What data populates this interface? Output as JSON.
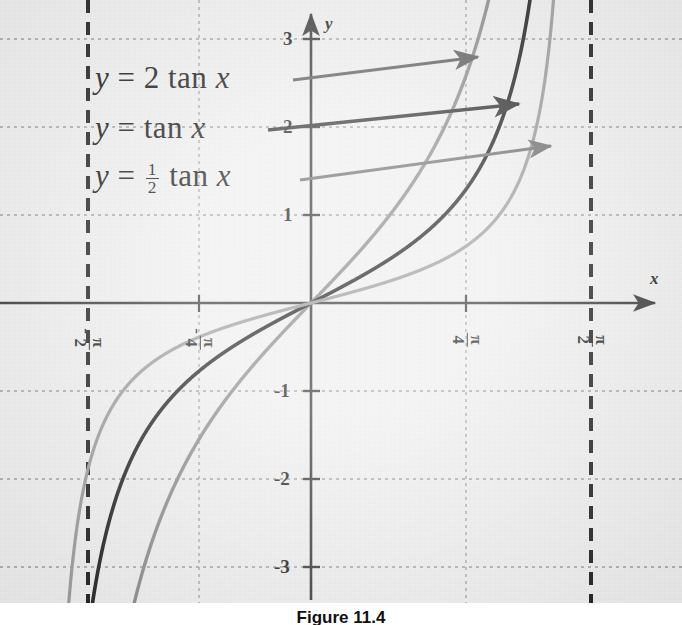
{
  "figure": {
    "caption": "Figure 11.4",
    "background_color": "#f0f0f0"
  },
  "chart_data": {
    "type": "line",
    "title": "",
    "xlabel": "x",
    "ylabel": "y",
    "xlim": [
      -1.8849,
      1.8849
    ],
    "ylim": [
      -3.45,
      3.45
    ],
    "grid": true,
    "legend_position": "inside-upper-left",
    "x_tick_labels": [
      "-π/2",
      "-π/4",
      "π/4",
      "π/2"
    ],
    "x_tick_values": [
      -1.5708,
      -0.7854,
      0.7854,
      1.5708
    ],
    "y_tick_labels": [
      "3",
      "2",
      "1",
      "-1",
      "-2",
      "-3"
    ],
    "y_tick_values": [
      3,
      2,
      1,
      -1,
      -2,
      -3
    ],
    "asymptotes": [
      -1.5708,
      1.5708
    ],
    "asymptote_style": "dashed",
    "asymptote_color": "#1a1a1a",
    "series": [
      {
        "name": "y = 2 tan x",
        "coefficient": 2,
        "color": "#8a8a8a",
        "points": [
          [
            -1.47,
            -19.9
          ],
          [
            -1.4,
            -11.6
          ],
          [
            -1.3,
            -7.28
          ],
          [
            -1.2,
            -5.15
          ],
          [
            -1.1,
            -3.87
          ],
          [
            -1.0,
            -3.11
          ],
          [
            -0.9,
            -2.51
          ],
          [
            -0.8,
            -2.06
          ],
          [
            -0.7,
            -1.69
          ],
          [
            -0.6,
            -1.37
          ],
          [
            -0.5,
            -1.09
          ],
          [
            -0.4,
            -0.85
          ],
          [
            -0.3,
            -0.62
          ],
          [
            -0.2,
            -0.41
          ],
          [
            -0.1,
            -0.2
          ],
          [
            0.0,
            0.0
          ],
          [
            0.1,
            0.2
          ],
          [
            0.2,
            0.41
          ],
          [
            0.3,
            0.62
          ],
          [
            0.4,
            0.85
          ],
          [
            0.5,
            1.09
          ],
          [
            0.6,
            1.37
          ],
          [
            0.7,
            1.69
          ],
          [
            0.8,
            2.06
          ],
          [
            0.9,
            2.51
          ],
          [
            1.0,
            3.11
          ],
          [
            1.1,
            3.87
          ],
          [
            1.2,
            5.15
          ],
          [
            1.3,
            7.28
          ],
          [
            1.4,
            11.6
          ],
          [
            1.47,
            19.9
          ]
        ]
      },
      {
        "name": "y = tan x",
        "coefficient": 1,
        "color": "#1f1f1f",
        "points": [
          [
            -1.5,
            -14.1
          ],
          [
            -1.45,
            -8.24
          ],
          [
            -1.4,
            -5.8
          ],
          [
            -1.3,
            -3.64
          ],
          [
            -1.2,
            -2.57
          ],
          [
            -1.1,
            -1.96
          ],
          [
            -1.0,
            -1.56
          ],
          [
            -0.9,
            -1.26
          ],
          [
            -0.8,
            -1.03
          ],
          [
            -0.7,
            -0.84
          ],
          [
            -0.6,
            -0.68
          ],
          [
            -0.5,
            -0.55
          ],
          [
            -0.4,
            -0.42
          ],
          [
            -0.3,
            -0.31
          ],
          [
            -0.2,
            -0.2
          ],
          [
            -0.1,
            -0.1
          ],
          [
            0.0,
            0.0
          ],
          [
            0.1,
            0.1
          ],
          [
            0.2,
            0.2
          ],
          [
            0.3,
            0.31
          ],
          [
            0.4,
            0.42
          ],
          [
            0.5,
            0.55
          ],
          [
            0.6,
            0.68
          ],
          [
            0.7,
            0.84
          ],
          [
            0.8,
            1.03
          ],
          [
            0.9,
            1.26
          ],
          [
            1.0,
            1.56
          ],
          [
            1.1,
            1.96
          ],
          [
            1.2,
            2.57
          ],
          [
            1.3,
            3.64
          ],
          [
            1.4,
            5.8
          ],
          [
            1.45,
            8.24
          ],
          [
            1.5,
            14.1
          ]
        ]
      },
      {
        "name": "y = 1/2 tan x",
        "coefficient": 0.5,
        "color": "#9a9a9a",
        "points": [
          [
            -1.53,
            -12.2
          ],
          [
            -1.5,
            -7.05
          ],
          [
            -1.45,
            -4.12
          ],
          [
            -1.4,
            -2.9
          ],
          [
            -1.3,
            -1.82
          ],
          [
            -1.2,
            -1.29
          ],
          [
            -1.1,
            -0.98
          ],
          [
            -1.0,
            -0.78
          ],
          [
            -0.9,
            -0.63
          ],
          [
            -0.8,
            -0.51
          ],
          [
            -0.7,
            -0.42
          ],
          [
            -0.6,
            -0.34
          ],
          [
            -0.5,
            -0.27
          ],
          [
            -0.4,
            -0.21
          ],
          [
            -0.3,
            -0.15
          ],
          [
            -0.2,
            -0.1
          ],
          [
            -0.1,
            -0.05
          ],
          [
            0.0,
            0.0
          ],
          [
            0.1,
            0.05
          ],
          [
            0.2,
            0.1
          ],
          [
            0.3,
            0.15
          ],
          [
            0.4,
            0.21
          ],
          [
            0.5,
            0.27
          ],
          [
            0.6,
            0.34
          ],
          [
            0.7,
            0.42
          ],
          [
            0.8,
            0.51
          ],
          [
            0.9,
            0.63
          ],
          [
            1.0,
            0.78
          ],
          [
            1.1,
            0.98
          ],
          [
            1.2,
            1.29
          ],
          [
            1.3,
            1.82
          ],
          [
            1.4,
            2.9
          ],
          [
            1.45,
            4.12
          ],
          [
            1.5,
            7.05
          ],
          [
            1.53,
            12.2
          ]
        ]
      }
    ],
    "annotations": [
      {
        "name": "label-2tanx",
        "text_parts": {
          "lhs": "y",
          "eq": "=",
          "coef": "2",
          "fn": "tan",
          "var": "x"
        },
        "is_fraction": false,
        "arrow_color": "#595959",
        "target_series": "y = 2 tan x"
      },
      {
        "name": "label-tanx",
        "text_parts": {
          "lhs": "y",
          "eq": "=",
          "coef": "",
          "fn": "tan",
          "var": "x"
        },
        "is_fraction": false,
        "arrow_color": "#2b2b2b",
        "target_series": "y = tan x"
      },
      {
        "name": "label-halftanx",
        "text_parts": {
          "lhs": "y",
          "eq": "=",
          "coef_num": "1",
          "coef_den": "2",
          "fn": "tan",
          "var": "x"
        },
        "is_fraction": true,
        "arrow_color": "#6e6e6e",
        "target_series": "y = 1/2 tan x"
      }
    ]
  },
  "axes": {
    "x_axis_label": "x",
    "y_axis_label": "y",
    "y_ticks": [
      {
        "label": "3"
      },
      {
        "label": "2"
      },
      {
        "label": "1"
      },
      {
        "label": "-1"
      },
      {
        "label": "-2"
      },
      {
        "label": "-3"
      }
    ],
    "x_ticks": [
      {
        "sign": "-",
        "num": "π",
        "den": "2"
      },
      {
        "sign": "-",
        "num": "π",
        "den": "4"
      },
      {
        "sign": "",
        "num": "π",
        "den": "4"
      },
      {
        "sign": "",
        "num": "π",
        "den": "2"
      }
    ]
  },
  "colors": {
    "grid": "#9a9a9a",
    "axis": "#333333",
    "asymptote": "#1a1a1a",
    "curve_dark": "#1f1f1f",
    "curve_gray_a": "#8a8a8a",
    "curve_gray_b": "#9a9a9a",
    "background": "#f0f0f0"
  }
}
